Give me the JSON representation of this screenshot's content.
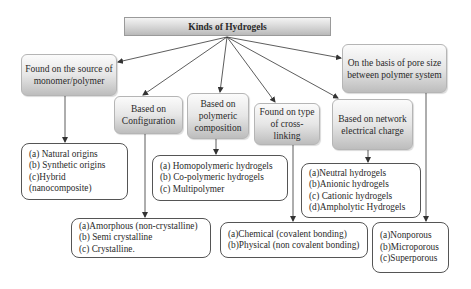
{
  "title": "Kinds of Hydrogels",
  "categories": [
    {
      "id": "source",
      "label": "Found on the source of monomer/polymer",
      "items": [
        "(a) Natural origins",
        "(b) Synthetic origins",
        "(c)Hybrid",
        "(nanocomposite)"
      ]
    },
    {
      "id": "configuration",
      "label": "Based on Configuration",
      "items": [
        "(a)Amorphous (non-crystalline)",
        "(b) Semi crystalline",
        "(c) Crystalline."
      ]
    },
    {
      "id": "composition",
      "label": "Based on polymeric composition",
      "items": [
        "(a) Homopolymeric hydrogels",
        "(b) Co-polymeric hydrogels",
        "(c) Multipolymer"
      ]
    },
    {
      "id": "crosslinking",
      "label": "Found on type of cross-linking",
      "items": [
        "(a)Chemical (covalent bonding)",
        "(b)Physical (non covalent bonding)"
      ]
    },
    {
      "id": "charge",
      "label": "Based on network electrical charge",
      "items": [
        "(a)Neutral hydrogels",
        "(b)Anionic hydrogels",
        "(c) Cationic hydrogels",
        "(d)Ampholytic Hydrogels"
      ]
    },
    {
      "id": "pore",
      "label": "On the basis of pore size between polymer system",
      "items": [
        "(a)Nonporous",
        "(b)Microporous",
        "(c)Superporous"
      ]
    }
  ],
  "colors": {
    "line": "#333333",
    "category_fill_top": "#fbfbfb",
    "category_fill_bottom": "#bdbdbd",
    "leaf_border": "#555555"
  }
}
